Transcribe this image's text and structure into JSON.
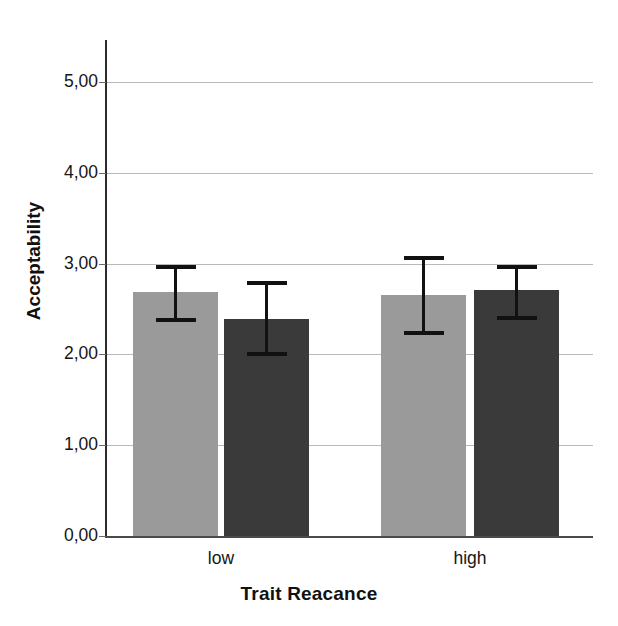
{
  "chart_data": {
    "type": "bar",
    "title": "",
    "xlabel": "Trait Reacance",
    "ylabel": "Acceptability",
    "categories": [
      "low",
      "high"
    ],
    "ylim": [
      0,
      5.5
    ],
    "yticks": [
      0,
      1,
      2,
      3,
      4,
      5
    ],
    "ytick_labels": [
      "0,00",
      "1,00",
      "2,00",
      "3,00",
      "4,00",
      "5,00"
    ],
    "grid": true,
    "legend": "none",
    "decimal_separator": ",",
    "error_bars": "95% CI",
    "series": [
      {
        "name": "series-light",
        "color": "#9a9a9a",
        "values": [
          2.69,
          2.65
        ],
        "error_upper": [
          2.99,
          3.08
        ],
        "error_lower": [
          2.36,
          2.21
        ]
      },
      {
        "name": "series-dark",
        "color": "#3a3a3a",
        "values": [
          2.39,
          2.71
        ],
        "error_upper": [
          2.81,
          2.99
        ],
        "error_lower": [
          1.98,
          2.38
        ]
      }
    ],
    "bars": [
      {
        "label": "low-light",
        "group": "low",
        "series": "series-light",
        "value": 2.69,
        "err_hi": 2.99,
        "err_lo": 2.36,
        "color": "#9a9a9a"
      },
      {
        "label": "low-dark",
        "group": "low",
        "series": "series-dark",
        "value": 2.39,
        "err_hi": 2.81,
        "err_lo": 1.98,
        "color": "#3a3a3a"
      },
      {
        "label": "high-light",
        "group": "high",
        "series": "series-light",
        "value": 2.65,
        "err_hi": 3.08,
        "err_lo": 2.21,
        "color": "#9a9a9a"
      },
      {
        "label": "high-dark",
        "group": "high",
        "series": "series-dark",
        "value": 2.71,
        "err_hi": 2.99,
        "err_lo": 2.38,
        "color": "#3a3a3a"
      }
    ]
  },
  "axes": {
    "y_title": "Acceptability",
    "x_title": "Trait Reacance",
    "y_labels": [
      "5,00",
      "4,00",
      "3,00",
      "2,00",
      "1,00",
      "0,00"
    ],
    "x_labels": [
      "low",
      "high"
    ]
  },
  "colors": {
    "light_bar": "#9a9a9a",
    "dark_bar": "#3a3a3a",
    "gridline": "#b9b9b9",
    "axis": "#2b2b2b",
    "text": "#161616",
    "background": "#ffffff"
  }
}
